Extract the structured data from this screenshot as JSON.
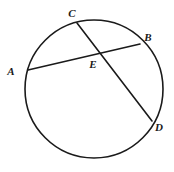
{
  "figure": {
    "kind": "circle-with-two-intersecting-chords",
    "canvas": {
      "width": 174,
      "height": 172
    },
    "background_color": "#FFFFFF",
    "stroke_color": "#1A1A1A",
    "label_color": "#1A1A1A",
    "circle": {
      "center_x": 94,
      "center_y": 89,
      "radius": 69,
      "stroke_width": 1.6,
      "fill": "none"
    },
    "chords": [
      {
        "name": "chord-AB",
        "from_point": "A",
        "to_point": "B",
        "x1": 28,
        "y1": 70,
        "x2": 140,
        "y2": 44,
        "stroke_width": 1.6
      },
      {
        "name": "chord-CD",
        "from_point": "C",
        "to_point": "D",
        "x1": 77,
        "y1": 23,
        "x2": 152,
        "y2": 121,
        "stroke_width": 1.6
      }
    ],
    "intersection": {
      "name": "E",
      "x": 97,
      "y": 54
    },
    "points": [
      {
        "id": "A",
        "label": "A",
        "on_circle": true,
        "x": 28,
        "y": 70,
        "label_x": 11,
        "label_y": 71
      },
      {
        "id": "B",
        "label": "B",
        "on_circle": true,
        "x": 140,
        "y": 44,
        "label_x": 148,
        "label_y": 37
      },
      {
        "id": "C",
        "label": "C",
        "on_circle": true,
        "x": 77,
        "y": 23,
        "label_x": 72,
        "label_y": 13
      },
      {
        "id": "D",
        "label": "D",
        "on_circle": true,
        "x": 152,
        "y": 121,
        "label_x": 159,
        "label_y": 127
      },
      {
        "id": "E",
        "label": "E",
        "on_circle": false,
        "x": 97,
        "y": 54,
        "label_x": 93,
        "label_y": 64
      }
    ]
  }
}
